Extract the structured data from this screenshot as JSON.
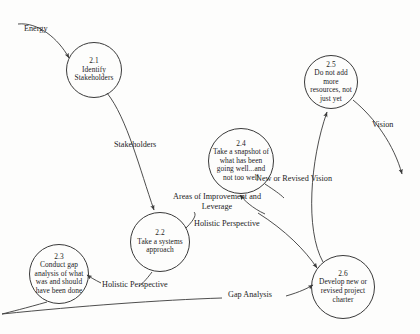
{
  "diagram": {
    "type": "data-flow-diagram",
    "background_color": "#fdfdfc",
    "stroke_color": "#3a3a3a",
    "text_color": "#1c1c1c",
    "nodes": [
      {
        "id": "2.1",
        "label": "Identify Stakeholders",
        "cx": 94,
        "cy": 70,
        "r": 28
      },
      {
        "id": "2.2",
        "label": "Take a systems approach",
        "cx": 160,
        "cy": 242,
        "r": 30
      },
      {
        "id": "2.3",
        "label": "Conduct gap analysis of what was and should have been done",
        "cx": 59,
        "cy": 274,
        "r": 30
      },
      {
        "id": "2.4",
        "label": "Take a snapshot of what has been going well...and not too well",
        "cx": 241,
        "cy": 161,
        "r": 33
      },
      {
        "id": "2.5",
        "label": "Do not add more resources, not just yet",
        "cx": 331,
        "cy": 82,
        "r": 27
      },
      {
        "id": "2.6",
        "label": "Develop new or revised project charter",
        "cx": 343,
        "cy": 287,
        "r": 32
      }
    ],
    "edges": [
      {
        "name": "energy-flow",
        "label": "Energy",
        "from": "external-input",
        "to": "2.1",
        "label_x": 30,
        "label_y": 29
      },
      {
        "name": "stakeholders-flow",
        "label": "Stakeholders",
        "from": "2.1",
        "to": "2.2",
        "label_x": 116,
        "label_y": 145
      },
      {
        "name": "holistic-perspective-to-2-4",
        "label": "Holistic Perspective",
        "from": "2.2",
        "to": "2.4",
        "label_x": 196,
        "label_y": 223
      },
      {
        "name": "holistic-perspective-to-2-3",
        "label": "Holistic Perspective",
        "from": "2.2",
        "to": "2.3",
        "label_x": 104,
        "label_y": 283
      },
      {
        "name": "areas-of-improvement-flow",
        "label": "Areas of Improvement and Leverage",
        "from": "2.4",
        "to": "2.6",
        "label_x": 193,
        "label_y": 198
      },
      {
        "name": "new-or-revised-vision-flow",
        "label": "New or Revised Vision",
        "from": "2.6",
        "to": "2.5",
        "label_x": 258,
        "label_y": 178
      },
      {
        "name": "vision-output-flow",
        "label": "Vision",
        "from": "2.5",
        "to": "external-output",
        "label_x": 378,
        "label_y": 125
      },
      {
        "name": "gap-analysis-flow",
        "label": "Gap Analysis",
        "from": "2.3",
        "to": "2.6",
        "label_x": 231,
        "label_y": 295
      }
    ]
  }
}
